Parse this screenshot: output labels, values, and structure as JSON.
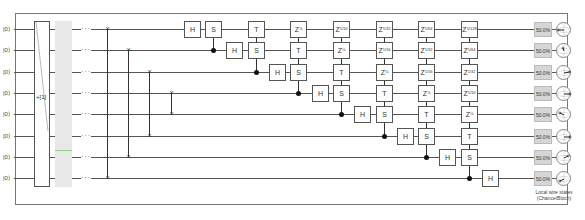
{
  "circuit": {
    "wire_count": 8,
    "inputs": [
      "|0⟩",
      "|0⟩",
      "|0⟩",
      "|0⟩",
      "|0⟩",
      "|0⟩",
      "|0⟩",
      "|0⟩"
    ],
    "input_block_label": "+[1]",
    "ellipsis": "···",
    "swaps": [
      {
        "a": 0,
        "b": 7
      },
      {
        "a": 1,
        "b": 6
      },
      {
        "a": 2,
        "b": 5
      },
      {
        "a": 3,
        "b": 4
      }
    ],
    "gates": {
      "H": "H",
      "S": "S",
      "T": "T",
      "Z": "Z"
    },
    "columns": [
      {
        "cells": [
          {
            "w": 0,
            "g": "H"
          }
        ]
      },
      {
        "cells": [
          {
            "w": 0,
            "g": "S"
          }
        ],
        "ctrl": 1
      },
      {
        "cells": [
          {
            "w": 1,
            "g": "H"
          }
        ]
      },
      {
        "cells": [
          {
            "w": 0,
            "g": "T"
          },
          {
            "w": 1,
            "g": "S"
          }
        ],
        "ctrl": 2
      },
      {
        "cells": [
          {
            "w": 2,
            "g": "H"
          }
        ]
      },
      {
        "cells": [
          {
            "w": 0,
            "g": "Z",
            "p": "⅛"
          },
          {
            "w": 1,
            "g": "T"
          },
          {
            "w": 2,
            "g": "S"
          }
        ],
        "ctrl": 3
      },
      {
        "cells": [
          {
            "w": 3,
            "g": "H"
          }
        ]
      },
      {
        "cells": [
          {
            "w": 0,
            "g": "Z",
            "p": "1/16"
          },
          {
            "w": 1,
            "g": "Z",
            "p": "⅛"
          },
          {
            "w": 2,
            "g": "T"
          },
          {
            "w": 3,
            "g": "S"
          }
        ],
        "ctrl": 4
      },
      {
        "cells": [
          {
            "w": 4,
            "g": "H"
          }
        ]
      },
      {
        "cells": [
          {
            "w": 0,
            "g": "Z",
            "p": "1/32"
          },
          {
            "w": 1,
            "g": "Z",
            "p": "1/16"
          },
          {
            "w": 2,
            "g": "Z",
            "p": "⅛"
          },
          {
            "w": 3,
            "g": "T"
          },
          {
            "w": 4,
            "g": "S"
          }
        ],
        "ctrl": 5
      },
      {
        "cells": [
          {
            "w": 5,
            "g": "H"
          }
        ]
      },
      {
        "cells": [
          {
            "w": 0,
            "g": "Z",
            "p": "1/64"
          },
          {
            "w": 1,
            "g": "Z",
            "p": "1/32"
          },
          {
            "w": 2,
            "g": "Z",
            "p": "1/16"
          },
          {
            "w": 3,
            "g": "Z",
            "p": "⅛"
          },
          {
            "w": 4,
            "g": "T"
          },
          {
            "w": 5,
            "g": "S"
          }
        ],
        "ctrl": 6
      },
      {
        "cells": [
          {
            "w": 6,
            "g": "H"
          }
        ]
      },
      {
        "cells": [
          {
            "w": 0,
            "g": "Z",
            "p": "1/128"
          },
          {
            "w": 1,
            "g": "Z",
            "p": "1/64"
          },
          {
            "w": 2,
            "g": "Z",
            "p": "1/32"
          },
          {
            "w": 3,
            "g": "Z",
            "p": "1/16"
          },
          {
            "w": 4,
            "g": "Z",
            "p": "⅛"
          },
          {
            "w": 5,
            "g": "T"
          },
          {
            "w": 6,
            "g": "S"
          }
        ],
        "ctrl": 7
      },
      {
        "cells": [
          {
            "w": 7,
            "g": "H"
          }
        ]
      }
    ]
  },
  "outputs": {
    "chances": [
      "50.0%",
      "50.0%",
      "50.0%",
      "50.0%",
      "50.0%",
      "50.0%",
      "50.0%",
      "50.0%"
    ],
    "bloch_angles_deg": [
      180,
      100,
      20,
      0,
      135,
      0,
      45,
      225
    ],
    "caption_line1": "Local wire states",
    "caption_line2": "(Chance/Bloch)"
  },
  "colors": {
    "wire": "#555555",
    "gate_border": "#555555",
    "chance_fill": "#d6d6d6",
    "display_fill": "#e8e8e8",
    "control_dot": "#111111"
  }
}
